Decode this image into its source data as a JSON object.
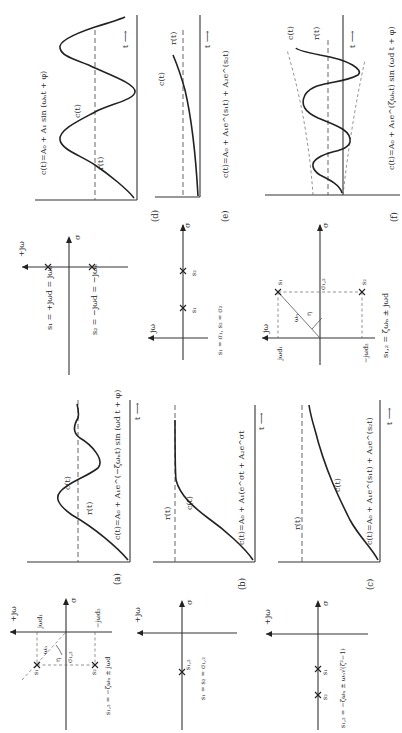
{
  "figure": {
    "orientation": "rotated 90 degrees counter-clockwise",
    "panels": [
      {
        "id": "a",
        "caption": "(a)",
        "pole_plot": {
          "axis_labels": {
            "imag": "+jω",
            "real": "σ"
          },
          "labels": [
            "jω_d1",
            "-jω_d2",
            "ω_n",
            "η",
            "σ_1,2",
            "s_1",
            "s_2"
          ],
          "equation": "s_1,2 = -ζω_n ± jω_d"
        },
        "response": {
          "equation": "c(t) = A_0 + A_1 e^{-ζω_n t} sin(ω_d t + φ)",
          "curve_labels": [
            "c(t)",
            "r(t)"
          ],
          "time_label": "t →"
        }
      },
      {
        "id": "b",
        "caption": "(b)",
        "pole_plot": {
          "axis_labels": {
            "imag": "+jω",
            "real": "σ"
          },
          "labels": [
            "s_1,2"
          ],
          "equation": "s_1 = s_2 = σ_1,2"
        },
        "response": {
          "equation": "c(t) = A_0 + A_1(e^{σt} + A_2 e^{σt}",
          "curve_labels": [
            "c(t)",
            "r(t)"
          ],
          "time_label": "t →"
        }
      },
      {
        "id": "c",
        "caption": "(c)",
        "pole_plot": {
          "axis_labels": {
            "imag": "+jω",
            "real": "σ"
          },
          "labels": [
            "s_1",
            "s_2"
          ],
          "equation": "s_1,2 = -ζω_n ± ω_n √(ζ² - 1)"
        },
        "response": {
          "equation": "c(t) = A_0 + A_1 e^{s_1 t} + A_2 e^{s_2 t}",
          "curve_labels": [
            "c(t)",
            "r(t)"
          ],
          "time_label": "t →"
        }
      },
      {
        "id": "d",
        "caption": "(d)",
        "pole_plot": {
          "axis_labels": {
            "imag": "+jω",
            "real": "σ"
          },
          "labels": [
            "s_1",
            "s_2"
          ],
          "equation_1": "s_1 = +jω_d = jω_n",
          "equation_2": "s_2 = -jω_d = -jω_n"
        },
        "response": {
          "equation": "c(t) = A_0 + A_1 sin(ω_n t + φ)",
          "curve_labels": [
            "c(t)",
            "r(t)"
          ],
          "time_label": "t →"
        }
      },
      {
        "id": "e",
        "caption": "(e)",
        "pole_plot": {
          "axis_labels": {
            "imag": "jω",
            "real": "σ"
          },
          "labels": [
            "s_1",
            "s_2"
          ],
          "equation": "s_1 = σ_1, s_2 = σ_2"
        },
        "response": {
          "equation": "c(t) = A_0 + A_1 e^{s_1 t} + A_2 e^{s_2 t}",
          "curve_labels": [
            "c(t)",
            "r(t)"
          ],
          "time_label": "t →"
        }
      },
      {
        "id": "f",
        "caption": "(f)",
        "pole_plot": {
          "axis_labels": {
            "imag": "jω",
            "real": "σ"
          },
          "labels": [
            "jω_d1",
            "-jω_d2",
            "ω_n",
            "η",
            "σ_1,2",
            "s_1",
            "s_2"
          ],
          "equation": "s_1,2 = ζω_n ± jω_d"
        },
        "response": {
          "equation": "c(t) = A_0 + A_1 e^{ζω_n t} sin(ω_d t + φ)",
          "curve_labels": [
            "c(t)",
            "r(t)"
          ],
          "time_label": "t →"
        }
      }
    ]
  },
  "text": {
    "a_cap": "(a)",
    "b_cap": "(b)",
    "c_cap": "(c)",
    "d_cap": "(d)",
    "e_cap": "(e)",
    "f_cap": "(f)",
    "t_arrow": "t ⟶",
    "ct": "c(t)",
    "rt": "r(t)",
    "pjw": "+jω",
    "jw": "jω",
    "sigma": "σ",
    "s1": "s₁",
    "s2": "s₂",
    "s12": "s₁,₂",
    "wn": "ωₙ",
    "eta": "η",
    "sig12": "σ₁,₂",
    "jwd1": "jωd₁",
    "mjwd2": "−jωd₂",
    "eq_a_resp": "c(t)=A₀ + A₁e^(−ζωₙt) sin (ωd t + φ)",
    "eq_b_resp": "c(t)=A₀ + A₁(e^σt + A₂e^σt",
    "eq_c_resp": "c(t)=A₀ + A₁e^(s₁t) + A₂e^(s₂t)",
    "eq_d_resp": "c(t)=A₀ + A₁ sin (ωₙt + φ)",
    "eq_e_resp": "c(t)=A₀ + A₁e^(s₁t) + A₂e^(s₂t)",
    "eq_f_resp": "c(t)=A₀ + A₁e^(ζωₙt) sin (ωd t + φ)",
    "eq_a_pole": "s₁,₂ = −ζωₙ ± jωd",
    "eq_b_pole": "s₁ = s₂ = σ₁,₂",
    "eq_c_pole": "s₁,₂ = −ζωₙ ± ωₙ√(ζ²−1)",
    "eq_d_pole1": "s₁ = +jωd = jωₙ",
    "eq_d_pole2": "s₂ = −jωd = −jωₙ",
    "eq_e_pole": "s₁ = σ₁, s₂ = σ₂",
    "eq_f_pole": "s₁,₂ = ζωₙ ± jωd"
  }
}
